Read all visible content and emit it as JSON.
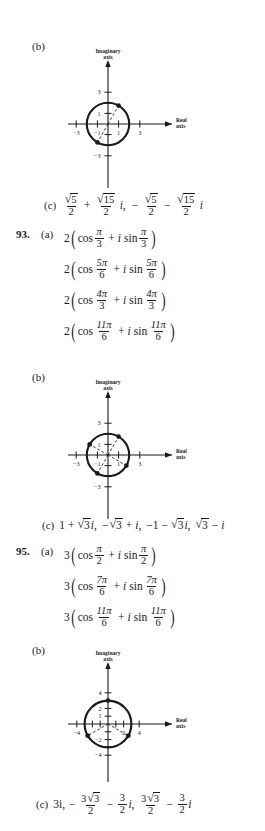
{
  "page": {
    "background": "#ffffff",
    "ink": "#1a1a1a",
    "type": "textbook-answer-key"
  },
  "blocks": [
    {
      "id": "b1",
      "part_label": "(b)",
      "kind": "argand-diagram"
    },
    {
      "id": "c1",
      "part_label": "(c)",
      "kind": "answer-line",
      "text": "√5/2 + √15/2 i,  −√5/2 − √15/2 i"
    },
    {
      "id": "ex93",
      "exercise_number": "93.",
      "part_label": "(a)",
      "kind": "trig-form-list"
    },
    {
      "id": "b2",
      "part_label": "(b)",
      "kind": "argand-diagram"
    },
    {
      "id": "c2",
      "part_label": "(c)",
      "kind": "answer-line",
      "text": "1 + √3i, −√3 + i, −1 − √3i, √3 − i"
    },
    {
      "id": "ex95",
      "exercise_number": "95.",
      "part_label": "(a)",
      "kind": "trig-form-list"
    },
    {
      "id": "b3",
      "part_label": "(b)",
      "kind": "argand-diagram"
    },
    {
      "id": "c3",
      "part_label": "(c)",
      "kind": "answer-line",
      "text": "3i, −3√3/2 − 3/2 i, 3√3/2 − 3/2 i"
    }
  ],
  "answers": {
    "c1": {
      "label": "(c)",
      "terms": [
        {
          "sign": "",
          "num_radicand": "5",
          "den": "2",
          "imag": false
        },
        {
          "sign": "+",
          "num_radicand": "15",
          "den": "2",
          "imag": true,
          "imag_symbol": "i"
        },
        {
          "sign": "−",
          "num_radicand": "5",
          "den": "2",
          "imag": false,
          "starts_term": true
        },
        {
          "sign": "−",
          "num_radicand": "15",
          "den": "2",
          "imag": true,
          "imag_symbol": "i"
        }
      ],
      "separator": ","
    },
    "c2": {
      "label": "(c)",
      "plain": "1 + √3i, −√3 + i, −1 − √3i, √3 − i",
      "pieces": [
        {
          "lead": "1",
          "op": "+",
          "radicand": "3",
          "suffix": "i"
        },
        {
          "lead": "−",
          "op": "",
          "radicand": "3",
          "suffix": "",
          "tail_op": "+",
          "tail": "i"
        },
        {
          "lead": "−1",
          "op": "−",
          "radicand": "3",
          "suffix": "i"
        },
        {
          "lead": "",
          "op": "",
          "radicand": "3",
          "suffix": "",
          "tail_op": "−",
          "tail": "i"
        }
      ]
    },
    "c3": {
      "label": "(c)",
      "first": "3i",
      "terms": [
        {
          "sign": "−",
          "coef": "3",
          "radicand": "3",
          "den": "2"
        },
        {
          "sign": "−",
          "coef": "3",
          "den": "2",
          "imag": "i"
        },
        {
          "sign": "",
          "coef": "3",
          "radicand": "3",
          "den": "2"
        },
        {
          "sign": "−",
          "coef": "3",
          "den": "2",
          "imag": "i"
        }
      ]
    }
  },
  "exercise_93": {
    "number": "93.",
    "part_a_label": "(a)",
    "modulus": "2",
    "cos_word": "cos",
    "sin_word": "sin",
    "i_symbol": "i",
    "plus": "+",
    "pi": "π",
    "entries": [
      {
        "num": "π",
        "den": "3"
      },
      {
        "num": "5π",
        "den": "6"
      },
      {
        "num": "4π",
        "den": "3"
      },
      {
        "num": "11π",
        "den": "6"
      }
    ]
  },
  "exercise_95": {
    "number": "95.",
    "part_a_label": "(a)",
    "modulus": "3",
    "cos_word": "cos",
    "sin_word": "sin",
    "i_symbol": "i",
    "plus": "+",
    "pi": "π",
    "entries": [
      {
        "num": "π",
        "den": "2"
      },
      {
        "num": "7π",
        "den": "6"
      },
      {
        "num": "11π",
        "den": "6"
      }
    ]
  },
  "diagrams": [
    {
      "id": "diagram-1",
      "part_label": "(b)",
      "imag_axis_label_line1": "Imaginary",
      "imag_axis_label_line2": "axis",
      "real_axis_label_line1": "Real",
      "real_axis_label_line2": "axis",
      "x_tick_labels": [
        "−3",
        "−1",
        "1",
        "3"
      ],
      "x_tick_values": [
        -3,
        -1,
        1,
        3
      ],
      "y_tick_labels": [
        "3",
        "1",
        "−3"
      ],
      "y_tick_values": [
        3,
        1,
        -3
      ],
      "circle_radius": 2,
      "points_degrees": [
        60,
        240
      ],
      "dashed_radii_degrees": [
        60,
        240
      ],
      "axis_min": -3.4,
      "axis_max": 3.4
    },
    {
      "id": "diagram-2",
      "part_label": "(b)",
      "imag_axis_label_line1": "Imaginary",
      "imag_axis_label_line2": "axis",
      "real_axis_label_line1": "Real",
      "real_axis_label_line2": "axis",
      "x_tick_labels": [
        "−3",
        "−1",
        "1",
        "3"
      ],
      "x_tick_values": [
        -3,
        -1,
        1,
        3
      ],
      "y_tick_labels": [
        "3",
        "1",
        "−3"
      ],
      "y_tick_values": [
        3,
        1,
        -3
      ],
      "circle_radius": 2,
      "points_degrees": [
        60,
        150,
        240,
        330
      ],
      "dashed_radii_degrees": [
        60,
        150,
        240,
        330
      ],
      "axis_min": -3.4,
      "axis_max": 3.4
    },
    {
      "id": "diagram-3",
      "part_label": "(b)",
      "imag_axis_label_line1": "Imaginary",
      "imag_axis_label_line2": "axis",
      "real_axis_label_line1": "Real",
      "real_axis_label_line2": "axis",
      "x_tick_labels": [
        "−4",
        "2",
        "4"
      ],
      "x_tick_values": [
        -4,
        2,
        4
      ],
      "y_tick_labels": [
        "4",
        "2",
        "1",
        "−2",
        "−4"
      ],
      "y_tick_values": [
        4,
        2,
        1,
        -2,
        -4
      ],
      "circle_radius": 3,
      "points_degrees": [
        90,
        210,
        330
      ],
      "dashed_radii_degrees": [
        210,
        330
      ],
      "axis_min": -4.6,
      "axis_max": 4.6
    }
  ]
}
